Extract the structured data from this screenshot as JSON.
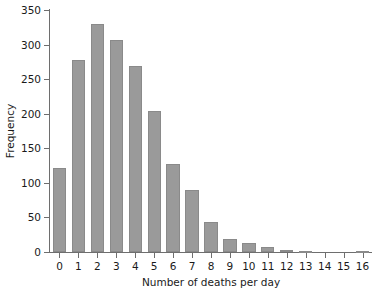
{
  "chart_data": {
    "type": "bar",
    "title": "",
    "xlabel": "Number of deaths per day",
    "ylabel": "Frequency",
    "categories": [
      "0",
      "1",
      "2",
      "3",
      "4",
      "5",
      "6",
      "7",
      "8",
      "9",
      "10",
      "11",
      "12",
      "13",
      "14",
      "15",
      "16"
    ],
    "values": [
      122,
      277,
      330,
      307,
      269,
      204,
      127,
      89,
      44,
      19,
      13,
      7,
      3,
      1,
      0,
      0,
      1
    ],
    "xlim": [
      -0.5,
      16.5
    ],
    "ylim": [
      0,
      350
    ],
    "yticks": [
      0,
      50,
      100,
      150,
      200,
      250,
      300,
      350
    ],
    "ytick_labels": [
      "0",
      "50",
      "100",
      "150",
      "200",
      "250",
      "300",
      "350"
    ],
    "xticks": [
      0,
      1,
      2,
      3,
      4,
      5,
      6,
      7,
      8,
      9,
      10,
      11,
      12,
      13,
      14,
      15,
      16
    ],
    "xtick_labels": [
      "0",
      "1",
      "2",
      "3",
      "4",
      "5",
      "6",
      "7",
      "8",
      "9",
      "10",
      "11",
      "12",
      "13",
      "14",
      "15",
      "16"
    ],
    "grid": false,
    "legend": null,
    "bar_color": "#9a9a9a",
    "bar_edge_color": "#8a8a8a",
    "axis_color": "#6e6e6e",
    "background_color": "#ffffff"
  }
}
